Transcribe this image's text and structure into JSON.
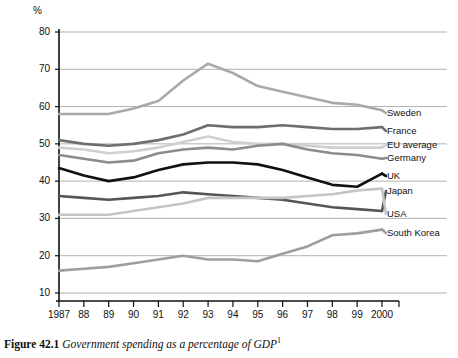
{
  "figure": {
    "caption_label": "Figure 42.1",
    "caption_title": "Government spending as a percentage of GDP",
    "caption_footnote_marker": "1"
  },
  "axes": {
    "y_unit_label": "%",
    "y_ticks": [
      "80",
      "70",
      "60",
      "50",
      "40",
      "30",
      "20",
      "10"
    ],
    "x_ticks": [
      "1987",
      "88",
      "89",
      "90",
      "91",
      "92",
      "93",
      "94",
      "95",
      "96",
      "97",
      "98",
      "99",
      "2000"
    ]
  },
  "legend": [
    {
      "label": "Sweden",
      "color": "#a9a9a9"
    },
    {
      "label": "France",
      "color": "#6e6e6e"
    },
    {
      "label": "EU average",
      "color": "#cfcfcf"
    },
    {
      "label": "Germany",
      "color": "#8c8c8c"
    },
    {
      "label": "UK",
      "color": "#111111"
    },
    {
      "label": "Japan",
      "color": "#555555"
    },
    {
      "label": "USA",
      "color": "#c4c4c4"
    },
    {
      "label": "South Korea",
      "color": "#9e9e9e"
    }
  ],
  "chart_data": {
    "type": "line",
    "title": "Government spending as a percentage of GDP",
    "xlabel": "",
    "ylabel": "%",
    "ylim": [
      10,
      80
    ],
    "grid": true,
    "legend_position": "right-inline",
    "x": [
      "1987",
      "1988",
      "1989",
      "1990",
      "1991",
      "1992",
      "1993",
      "1994",
      "1995",
      "1996",
      "1997",
      "1998",
      "1999",
      "2000"
    ],
    "series": [
      {
        "name": "Sweden",
        "color": "#a9a9a9",
        "values": [
          58.0,
          58.0,
          58.0,
          59.5,
          61.5,
          67.0,
          71.5,
          69.0,
          65.5,
          64.0,
          62.5,
          61.0,
          60.5,
          59.0
        ]
      },
      {
        "name": "France",
        "color": "#6e6e6e",
        "values": [
          51.0,
          50.0,
          49.5,
          50.0,
          51.0,
          52.5,
          55.0,
          54.5,
          54.5,
          55.0,
          54.5,
          54.0,
          54.0,
          54.5
        ]
      },
      {
        "name": "EU average",
        "color": "#cfcfcf",
        "values": [
          49.0,
          48.5,
          47.5,
          48.0,
          49.0,
          50.5,
          52.0,
          50.5,
          50.0,
          50.0,
          49.5,
          49.0,
          49.0,
          49.0
        ]
      },
      {
        "name": "Germany",
        "color": "#8c8c8c",
        "values": [
          47.0,
          46.0,
          45.0,
          45.5,
          47.5,
          48.5,
          49.0,
          48.5,
          49.5,
          50.0,
          48.5,
          47.5,
          47.0,
          46.0
        ]
      },
      {
        "name": "UK",
        "color": "#111111",
        "values": [
          43.5,
          41.5,
          40.0,
          41.0,
          43.0,
          44.5,
          45.0,
          45.0,
          44.5,
          43.0,
          41.0,
          39.0,
          38.5,
          42.0
        ]
      },
      {
        "name": "Japan",
        "color": "#555555",
        "values": [
          36.0,
          35.5,
          35.0,
          35.5,
          36.0,
          37.0,
          36.5,
          36.0,
          35.5,
          35.0,
          34.0,
          33.0,
          32.5,
          32.0
        ]
      },
      {
        "name": "USA",
        "color": "#c4c4c4",
        "values": [
          31.0,
          31.0,
          31.0,
          32.0,
          33.0,
          34.0,
          35.5,
          35.5,
          35.5,
          35.5,
          36.0,
          36.5,
          37.5,
          38.0
        ]
      },
      {
        "name": "South Korea",
        "color": "#9e9e9e",
        "values": [
          16.0,
          16.5,
          17.0,
          18.0,
          19.0,
          20.0,
          19.0,
          19.0,
          18.5,
          20.5,
          22.5,
          25.5,
          26.0,
          27.0
        ]
      }
    ]
  }
}
